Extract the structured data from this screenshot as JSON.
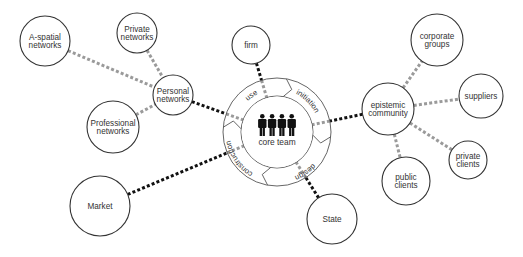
{
  "diagram": {
    "core": {
      "label": "core team",
      "center": [
        277,
        132
      ],
      "inner_radius": 36,
      "outer_radius": 54,
      "figure_count": 4,
      "phases": [
        {
          "label": "use",
          "angle": -125
        },
        {
          "label": "initiation",
          "angle": -45
        },
        {
          "label": "design",
          "angle": 55
        },
        {
          "label": "construction",
          "angle": 145
        }
      ],
      "chevron_angles": [
        -80,
        5,
        100,
        185
      ]
    },
    "nodes": [
      {
        "id": "a-spatial",
        "lines": [
          "A-spatial",
          "networks"
        ],
        "cx": 45,
        "cy": 41,
        "r": 25
      },
      {
        "id": "private-networks",
        "lines": [
          "Private",
          "networks"
        ],
        "cx": 137,
        "cy": 33,
        "r": 20
      },
      {
        "id": "personal-networks",
        "lines": [
          "Personal",
          "networks"
        ],
        "cx": 173,
        "cy": 95,
        "r": 20
      },
      {
        "id": "professional-networks",
        "lines": [
          "Professional",
          "networks"
        ],
        "cx": 113,
        "cy": 127,
        "r": 26
      },
      {
        "id": "market",
        "lines": [
          "Market"
        ],
        "cx": 100,
        "cy": 206,
        "r": 30
      },
      {
        "id": "firm",
        "lines": [
          "firm"
        ],
        "cx": 251,
        "cy": 45,
        "r": 19
      },
      {
        "id": "state",
        "lines": [
          "State"
        ],
        "cx": 332,
        "cy": 219,
        "r": 25
      },
      {
        "id": "epistemic-community",
        "lines": [
          "epistemic",
          "community"
        ],
        "cx": 388,
        "cy": 109,
        "r": 26
      },
      {
        "id": "corporate-groups",
        "lines": [
          "corporate",
          "groups"
        ],
        "cx": 437,
        "cy": 40,
        "r": 26
      },
      {
        "id": "suppliers",
        "lines": [
          "suppliers"
        ],
        "cx": 481,
        "cy": 96,
        "r": 22
      },
      {
        "id": "private-clients",
        "lines": [
          "private",
          "clients"
        ],
        "cx": 468,
        "cy": 160,
        "r": 19
      },
      {
        "id": "public-clients",
        "lines": [
          "public",
          "clients"
        ],
        "cx": 406,
        "cy": 181,
        "r": 24
      }
    ],
    "core_links": [
      "personal-networks",
      "market",
      "firm",
      "state",
      "epistemic-community"
    ],
    "satellite_links": [
      [
        "a-spatial",
        "personal-networks"
      ],
      [
        "private-networks",
        "personal-networks"
      ],
      [
        "professional-networks",
        "personal-networks"
      ],
      [
        "epistemic-community",
        "corporate-groups"
      ],
      [
        "epistemic-community",
        "suppliers"
      ],
      [
        "epistemic-community",
        "private-clients"
      ],
      [
        "epistemic-community",
        "public-clients"
      ]
    ],
    "colors": {
      "strong_link": "#111111",
      "weak_link": "#9a9a9a",
      "outline": "#333333"
    }
  }
}
